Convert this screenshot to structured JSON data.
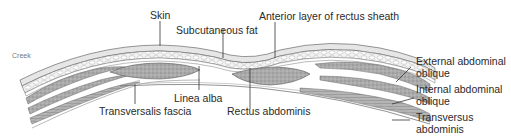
{
  "diagram": {
    "type": "anatomical cross-section",
    "watermark": "Creek",
    "labels": {
      "skin": "Skin",
      "subcutaneous_fat": "Subcutaneous fat",
      "anterior_rectus_sheath": "Anterior layer of rectus sheath",
      "external_oblique_line1": "External abdominal",
      "external_oblique_line2": "oblique",
      "internal_oblique_line1": "Internal abdominal",
      "internal_oblique_line2": "oblique",
      "transversus_line1": "Transversus",
      "transversus_line2": "abdominis",
      "linea_alba": "Linea alba",
      "transversalis_fascia": "Transversalis fascia",
      "rectus_abdominis": "Rectus abdominis"
    },
    "colors": {
      "line": "#333333",
      "skin": "#e8e8e8",
      "fat": "#f4f4f4",
      "muscle": "#a9a9a9",
      "muscle_dark": "#8c8c8c",
      "fascia": "#ffffff"
    }
  }
}
